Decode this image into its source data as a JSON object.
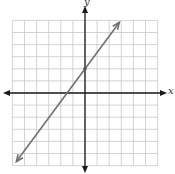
{
  "chart_data": {
    "type": "line",
    "title": "",
    "xlabel": "x",
    "ylabel": "y",
    "xlim": [
      -6,
      6
    ],
    "ylim": [
      -6,
      6
    ],
    "grid": true,
    "grid_step": 1,
    "legend": null,
    "series": [
      {
        "name": "line",
        "equation": "y = (4/3)x + 2",
        "slope": 1.3333,
        "y_intercept": 2,
        "x_intercept": -1.5,
        "points": [
          [
            -6,
            -6
          ],
          [
            -1.5,
            0
          ],
          [
            0,
            2
          ],
          [
            3,
            6
          ]
        ],
        "arrows_both_ends": true,
        "marked_point": [
          0,
          2
        ]
      }
    ]
  },
  "colors": {
    "grid": "#c8c8c8",
    "axis": "#1a1a1a",
    "line": "#707070"
  },
  "labels": {
    "x_axis": "x",
    "y_axis": "y"
  }
}
